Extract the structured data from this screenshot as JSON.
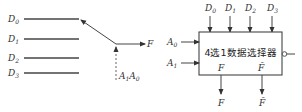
{
  "left_diagram": {
    "name": "switch-model",
    "inputs": [
      {
        "label": "D",
        "sub": "0"
      },
      {
        "label": "D",
        "sub": "1"
      },
      {
        "label": "D",
        "sub": "2"
      },
      {
        "label": "D",
        "sub": "3"
      }
    ],
    "output": {
      "label": "F"
    },
    "select": {
      "label": "A",
      "sub1": "1",
      "mid": "A",
      "sub2": "0"
    }
  },
  "right_diagram": {
    "name": "mux-block",
    "block_title": "4选1数据选择器",
    "data_inputs": [
      {
        "label": "D",
        "sub": "0"
      },
      {
        "label": "D",
        "sub": "1"
      },
      {
        "label": "D",
        "sub": "2"
      },
      {
        "label": "D",
        "sub": "3"
      }
    ],
    "select_inputs": [
      {
        "label": "A",
        "sub": "0"
      },
      {
        "label": "A",
        "sub": "1"
      }
    ],
    "inner_outputs": [
      {
        "label": "F"
      },
      {
        "label": "F̄"
      }
    ],
    "outputs": [
      {
        "label": "F"
      },
      {
        "label": "F̄"
      }
    ]
  },
  "colors": {
    "line": "#444444",
    "text": "#333333",
    "background": "#ffffff"
  }
}
